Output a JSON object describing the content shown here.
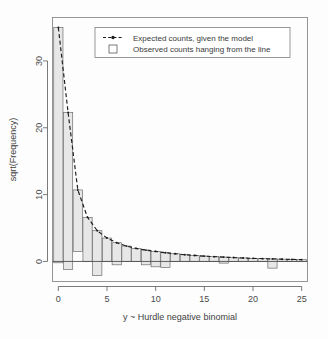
{
  "chart_data": {
    "type": "bar",
    "title": "",
    "subtitle": "",
    "xlabel": "y ~ Hurdle negative binomial",
    "ylabel": "sqrt(Frequency)",
    "xlim": [
      -0.6,
      25.6
    ],
    "ylim": [
      -3.0,
      36.5
    ],
    "xticks": [
      0,
      5,
      10,
      15,
      20,
      25
    ],
    "yticks": [
      0,
      10,
      20,
      30
    ],
    "grid": false,
    "legend_position": "top-center",
    "legend": [
      {
        "key": "dashed-line-with-point",
        "label": "Expected counts, given the model"
      },
      {
        "key": "open-rectangle",
        "label": "Observed counts hanging from the line"
      }
    ],
    "x": [
      0,
      1,
      2,
      3,
      4,
      5,
      6,
      7,
      8,
      9,
      10,
      11,
      12,
      13,
      14,
      15,
      16,
      17,
      18,
      19,
      20,
      21,
      22,
      23,
      24,
      25
    ],
    "series": [
      {
        "name": "Expected counts, given the model",
        "type": "line",
        "values": [
          35.0,
          22.3,
          10.7,
          6.6,
          4.6,
          3.5,
          2.8,
          2.3,
          1.95,
          1.7,
          1.5,
          1.3,
          1.15,
          1.0,
          0.9,
          0.8,
          0.72,
          0.65,
          0.58,
          0.52,
          0.46,
          0.42,
          0.38,
          0.34,
          0.3,
          0.27
        ]
      },
      {
        "name": "Observed counts hanging from the line",
        "type": "bar_hanging",
        "values": [
          35.2,
          22.5,
          9.2,
          6.6,
          2.5,
          3.5,
          2.3,
          2.3,
          1.95,
          1.2,
          0.7,
          0.4,
          1.15,
          1.0,
          0.9,
          0.8,
          0.72,
          0.9,
          0.58,
          0.52,
          0.46,
          0.42,
          0.0,
          0.34,
          0.3,
          0.27
        ]
      }
    ],
    "bar_tops": [
      35.0,
      22.3,
      10.7,
      6.6,
      4.6,
      3.5,
      2.8,
      2.3,
      1.95,
      1.7,
      1.5,
      1.3,
      1.15,
      1.0,
      0.9,
      0.8,
      0.72,
      0.65,
      0.58,
      0.52,
      0.46,
      0.42,
      0.38,
      0.34,
      0.3,
      0.27
    ],
    "bar_bottoms": [
      -0.2,
      -1.2,
      1.5,
      0.0,
      -2.1,
      0.0,
      -0.5,
      0.0,
      0.0,
      -0.5,
      -0.8,
      -0.9,
      0.0,
      0.0,
      0.0,
      0.0,
      0.0,
      -0.25,
      0.0,
      0.0,
      0.0,
      0.0,
      -1.0,
      0.0,
      0.0,
      0.0
    ],
    "bar_width": 0.95
  }
}
